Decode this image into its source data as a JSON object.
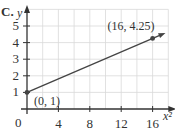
{
  "option_label": "C.",
  "chart_data": {
    "type": "line",
    "title": "",
    "xlabel": "x²",
    "ylabel": "y",
    "x_ticks": [
      4,
      8,
      12,
      16
    ],
    "y_ticks": [
      1,
      2,
      3,
      4,
      5
    ],
    "origin_label": "0",
    "xlim": [
      0,
      18
    ],
    "ylim": [
      0,
      6
    ],
    "grid": true,
    "grid_step_x": 2,
    "grid_step_y": 1,
    "series": [
      {
        "name": "line",
        "points": [
          [
            0,
            1
          ],
          [
            16,
            4.25
          ]
        ],
        "arrow_end": true
      }
    ],
    "annotations": [
      {
        "text": "(0, 1)",
        "x": 0,
        "y": 1
      },
      {
        "text": "(16, 4.25)",
        "x": 16,
        "y": 4.25
      }
    ]
  },
  "colors": {
    "axis": "#333333",
    "grid": "#d9d9d9",
    "line": "#444444",
    "text": "#333333"
  }
}
